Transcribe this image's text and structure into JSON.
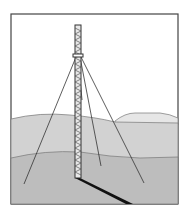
{
  "illustration": {
    "subject": "guyed lattice mast on rolling hills",
    "colors": {
      "frame": "#444444",
      "sky": "#ffffff",
      "far_hill": "#e6e6e6",
      "mid_ground": "#d2d2d2",
      "near_ground": "#bdbdbd",
      "mast": "#333333",
      "shadow": "#111111",
      "guy_wire": "#333333"
    },
    "guy_wire_count": 4
  }
}
